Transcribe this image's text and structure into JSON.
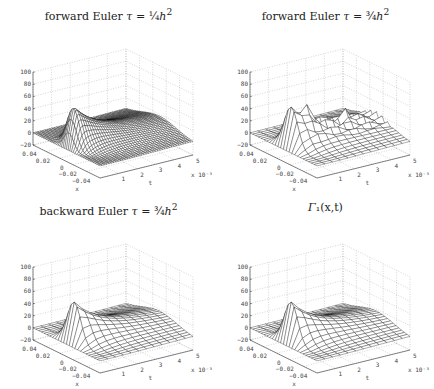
{
  "chart_data": [
    {
      "type": "surface",
      "title": "forward Euler τ = 1/4 h²",
      "title_parts": {
        "prefix": "forward Euler ",
        "tau": "τ",
        "eq": " = ",
        "frac": "¼",
        "h": "h",
        "sup": "2"
      },
      "xlabel": "x",
      "ylabel": "t",
      "zlabel": "",
      "x_ticks": [
        "0.04",
        "0.02",
        "0",
        "−0.02",
        "−0.04"
      ],
      "t_ticks": [
        "1",
        "2",
        "3",
        "4",
        "5"
      ],
      "t_multiplier": "x 10⁻³",
      "z_ticks": [
        "100",
        "80",
        "60",
        "40",
        "20",
        "0",
        "−20"
      ],
      "zlim": [
        -20,
        100
      ],
      "xlim": [
        -0.05,
        0.05
      ],
      "tlim": [
        0,
        0.005
      ],
      "grid": true,
      "mesh_density": "fine",
      "oscillation": false,
      "peak": 85,
      "plateau": 25
    },
    {
      "type": "surface",
      "title": "forward Euler τ = 3/4 h²",
      "title_parts": {
        "prefix": "forward Euler ",
        "tau": "τ",
        "eq": " = ",
        "frac": "¾",
        "h": "h",
        "sup": "2"
      },
      "xlabel": "x",
      "ylabel": "t",
      "x_ticks": [
        "0.04",
        "0.02",
        "0",
        "−0.02",
        "−0.04"
      ],
      "t_ticks": [
        "1",
        "2",
        "3",
        "4",
        "5"
      ],
      "t_multiplier": "x 10⁻³",
      "z_ticks": [
        "100",
        "80",
        "60",
        "40",
        "20",
        "0",
        "−20"
      ],
      "zlim": [
        -20,
        100
      ],
      "grid": true,
      "mesh_density": "coarse",
      "oscillation": true,
      "peak": 85,
      "plateau": 25
    },
    {
      "type": "surface",
      "title": "backward Euler τ = 3/4 h²",
      "title_parts": {
        "prefix": "backward Euler ",
        "tau": "τ",
        "eq": " = ",
        "frac": "¾",
        "h": "h",
        "sup": "2"
      },
      "xlabel": "x",
      "ylabel": "t",
      "x_ticks": [
        "0.04",
        "0.02",
        "0",
        "−0.02",
        "−0.04"
      ],
      "t_ticks": [
        "1",
        "2",
        "3",
        "4",
        "5"
      ],
      "t_multiplier": "x 10⁻³",
      "z_ticks": [
        "100",
        "80",
        "60",
        "40",
        "20",
        "0",
        "−20"
      ],
      "zlim": [
        -20,
        100
      ],
      "grid": true,
      "mesh_density": "coarse",
      "oscillation": false,
      "peak": 85,
      "plateau": 25
    },
    {
      "type": "surface",
      "title": "Γ₁(x,t)",
      "title_parts": {
        "prefix": "",
        "tau": "Γ",
        "eq": "₁(x,t)",
        "frac": "",
        "h": "",
        "sup": ""
      },
      "xlabel": "x",
      "ylabel": "t",
      "x_ticks": [
        "0.04",
        "0.02",
        "0",
        "−0.02",
        "−0.04"
      ],
      "t_ticks": [
        "1",
        "2",
        "3",
        "4",
        "5"
      ],
      "t_multiplier": "x 10⁻³",
      "z_ticks": [
        "100",
        "80",
        "60",
        "40",
        "20",
        "0",
        "−20"
      ],
      "zlim": [
        -20,
        100
      ],
      "grid": true,
      "mesh_density": "coarse",
      "oscillation": false,
      "peak": 85,
      "plateau": 25
    }
  ]
}
